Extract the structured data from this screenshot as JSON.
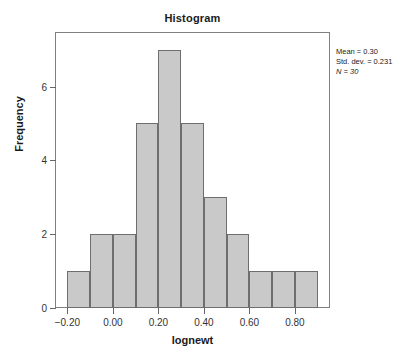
{
  "chart_data": {
    "type": "bar",
    "title": "Histogram",
    "xlabel": "lognewt",
    "ylabel": "Frequency",
    "bin_width": 0.1,
    "bin_edges": [
      -0.2,
      -0.1,
      0.0,
      0.1,
      0.2,
      0.3,
      0.4,
      0.5,
      0.6,
      0.7,
      0.8,
      0.9
    ],
    "categories": [
      "-0.20 to -0.10",
      "-0.10 to 0.00",
      "0.00 to 0.10",
      "0.10 to 0.20",
      "0.20 to 0.30",
      "0.30 to 0.40",
      "0.40 to 0.50",
      "0.50 to 0.60",
      "0.60 to 0.70",
      "0.70 to 0.80",
      "0.80 to 0.90"
    ],
    "values": [
      1,
      2,
      2,
      5,
      7,
      5,
      3,
      2,
      1,
      1,
      1
    ],
    "xlim": [
      -0.25,
      0.95
    ],
    "ylim": [
      0,
      7.45
    ],
    "xticks": [
      -0.2,
      0.0,
      0.2,
      0.4,
      0.6,
      0.8
    ],
    "xtick_labels": [
      "-0.20",
      "0.00",
      "0.20",
      "0.40",
      "0.60",
      "0.80"
    ],
    "yticks": [
      0,
      2,
      4,
      6
    ],
    "ytick_labels": [
      "0",
      "2",
      "4",
      "6"
    ],
    "grid": false,
    "legend": "none",
    "bar_fill_color": "#c9c9c9",
    "bar_edge_color": "#6e6e6e",
    "frame_color": "#808080"
  },
  "annotations": {
    "mean": "Mean = 0.30",
    "std_dev": "Std. dev. = 0.231",
    "n": "N = 30"
  }
}
